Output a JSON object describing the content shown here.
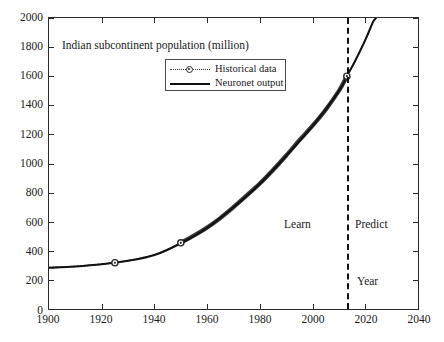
{
  "chart_data": {
    "type": "line",
    "title": "Indian subcontinent population (million)",
    "xlabel": "Year",
    "ylabel": "",
    "xlim": [
      1900,
      2040
    ],
    "ylim": [
      0,
      2000
    ],
    "xticks": [
      1900,
      1920,
      1940,
      1960,
      1980,
      2000,
      2020,
      2040
    ],
    "yticks": [
      0,
      200,
      400,
      600,
      800,
      1000,
      1200,
      1400,
      1600,
      1800,
      2000
    ],
    "grid": false,
    "legend_position": "top-center",
    "series": [
      {
        "name": "Historical data",
        "style": "dotted-with-circle-markers",
        "color": "#3a3a3a",
        "x": [
          1900,
          1905,
          1910,
          1915,
          1920,
          1925,
          1930,
          1935,
          1940,
          1945,
          1950,
          1955,
          1960,
          1965,
          1970,
          1975,
          1980,
          1985,
          1990,
          1995,
          2000,
          2005,
          2010,
          2013
        ],
        "values": [
          285,
          288,
          293,
          300,
          308,
          318,
          332,
          350,
          372,
          405,
          455,
          505,
          560,
          625,
          700,
          780,
          862,
          955,
          1055,
          1160,
          1260,
          1370,
          1500,
          1600
        ]
      },
      {
        "name": "Neuronet output",
        "style": "solid",
        "color": "#111111",
        "x": [
          1900,
          1910,
          1920,
          1930,
          1940,
          1950,
          1960,
          1970,
          1980,
          1990,
          2000,
          2010,
          2013,
          2016,
          2019,
          2021,
          2023,
          2024,
          2025
        ],
        "values": [
          283,
          292,
          307,
          331,
          371,
          452,
          558,
          699,
          861,
          1053,
          1258,
          1498,
          1600,
          1700,
          1810,
          1890,
          1975,
          2000,
          2060
        ]
      }
    ],
    "annotations": [
      {
        "text": "Learn",
        "x": 1993,
        "y": 640
      },
      {
        "text": "Predict",
        "x": 2021,
        "y": 640
      },
      {
        "text": "Year",
        "x": 2021,
        "y": 210
      }
    ],
    "divider": {
      "x": 2013,
      "style": "dash-dot",
      "color": "#111111"
    }
  },
  "legend": {
    "entries": [
      {
        "label": "Historical data",
        "marker": "circle-marker-icon"
      },
      {
        "label": "Neuronet output",
        "marker": "solid-line-icon"
      }
    ]
  }
}
